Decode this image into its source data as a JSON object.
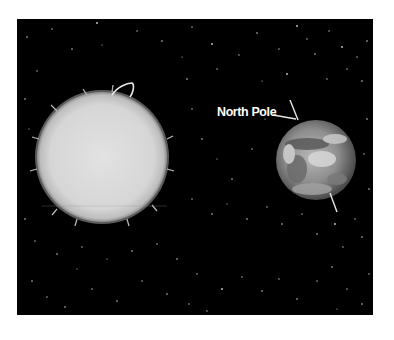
{
  "scene": {
    "description": "Sun and Earth in space with Earth's tilted axis",
    "background_color": "#000000",
    "page_color": "#ffffff"
  },
  "sun": {
    "cx": 85,
    "cy": 138,
    "r": 65,
    "color": "#dcdcdc"
  },
  "earth": {
    "cx": 299,
    "cy": 141,
    "r": 40
  },
  "labels": {
    "north_pole": "North Pole"
  }
}
